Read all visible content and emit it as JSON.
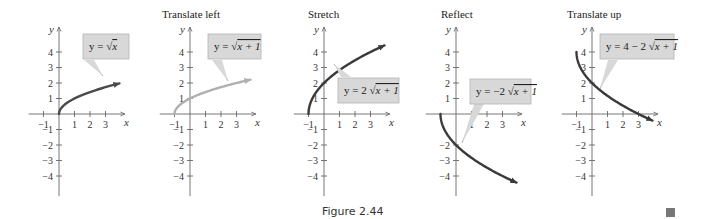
{
  "figure": {
    "caption": "Figure 2.44",
    "end_marker": "end-of-example-square"
  },
  "panels": [
    {
      "title": "",
      "label": "y = √x"
    },
    {
      "title": "Translate left",
      "label": "y = √x + 1"
    },
    {
      "title": "Stretch",
      "label": "y = 2 √x + 1"
    },
    {
      "title": "Reflect",
      "label": "y = −2 √x + 1"
    },
    {
      "title": "Translate up",
      "label": "y = 4 − 2 √x + 1"
    }
  ],
  "colors": {
    "axis": "#666666",
    "curve_dark": "#3a3a3a",
    "curve_light": "#b0b0b0",
    "label_fill": "#d8d8d8",
    "label_border": "#b5b5b5"
  },
  "chart_data": [
    {
      "type": "line",
      "title": "",
      "series": [
        {
          "name": "y = sqrt(x)",
          "x": [
            0,
            0.25,
            1,
            2,
            3,
            3.9
          ],
          "y": [
            0,
            0.5,
            1,
            1.41,
            1.73,
            1.97
          ]
        }
      ],
      "xlabel": "x",
      "ylabel": "y",
      "xticks": [
        -1,
        1,
        2,
        3
      ],
      "yticks": [
        4,
        3,
        2,
        1,
        -1,
        -2,
        -3,
        -4
      ],
      "xlim": [
        -1.9,
        4.2
      ],
      "ylim": [
        -5,
        5
      ],
      "annotation": "y = √x",
      "curve_color": "#4a4a4a"
    },
    {
      "type": "line",
      "title": "Translate left",
      "series": [
        {
          "name": "y = sqrt(x+1)",
          "x": [
            -1,
            -0.75,
            0,
            1,
            2,
            3,
            3.9
          ],
          "y": [
            0,
            0.5,
            1,
            1.41,
            1.73,
            2,
            2.21
          ]
        }
      ],
      "xlabel": "x",
      "ylabel": "y",
      "xticks": [
        -1,
        1,
        2,
        3
      ],
      "yticks": [
        4,
        3,
        2,
        1,
        -1,
        -2,
        -3,
        -4
      ],
      "xlim": [
        -1.9,
        4.2
      ],
      "ylim": [
        -5,
        5
      ],
      "annotation": "y = √(x + 1)",
      "curve_color": "#b0b0b0"
    },
    {
      "type": "line",
      "title": "Stretch",
      "series": [
        {
          "name": "y = 2 sqrt(x+1)",
          "x": [
            -1,
            -0.75,
            0,
            1,
            2,
            3,
            3.9
          ],
          "y": [
            0,
            1,
            2,
            2.83,
            3.46,
            4,
            4.43
          ]
        }
      ],
      "xlabel": "x",
      "ylabel": "y",
      "xticks": [
        -1,
        1,
        2,
        3
      ],
      "yticks": [
        4,
        3,
        2,
        1,
        -1,
        -2,
        -3,
        -4
      ],
      "xlim": [
        -1.9,
        4.2
      ],
      "ylim": [
        -5,
        5
      ],
      "annotation": "y = 2√(x + 1)",
      "curve_color": "#3a3a3a"
    },
    {
      "type": "line",
      "title": "Reflect",
      "series": [
        {
          "name": "y = -2 sqrt(x+1)",
          "x": [
            -1,
            -0.75,
            0,
            1,
            2,
            3,
            3.9
          ],
          "y": [
            0,
            -1,
            -2,
            -2.83,
            -3.46,
            -4,
            -4.43
          ]
        }
      ],
      "xlabel": "x",
      "ylabel": "y",
      "xticks": [
        1,
        2,
        3
      ],
      "yticks": [
        4,
        3,
        2,
        1,
        -2,
        -3,
        -4
      ],
      "xlim": [
        -1.9,
        4.2
      ],
      "ylim": [
        -5,
        5
      ],
      "annotation": "y = −2√(x + 1)",
      "curve_color": "#3a3a3a"
    },
    {
      "type": "line",
      "title": "Translate up",
      "series": [
        {
          "name": "y = 4 - 2 sqrt(x+1)",
          "x": [
            -1,
            -0.75,
            0,
            1,
            2,
            3,
            3.9
          ],
          "y": [
            4,
            3,
            2,
            1.17,
            0.54,
            0,
            -0.43
          ]
        }
      ],
      "xlabel": "x",
      "ylabel": "y",
      "xticks": [
        -1,
        1,
        2,
        3
      ],
      "yticks": [
        4,
        3,
        2,
        1,
        -1,
        -2,
        -3,
        -4
      ],
      "xlim": [
        -1.9,
        4.2
      ],
      "ylim": [
        -5,
        5
      ],
      "annotation": "y = 4 − 2√(x + 1)",
      "curve_color": "#3a3a3a"
    }
  ]
}
